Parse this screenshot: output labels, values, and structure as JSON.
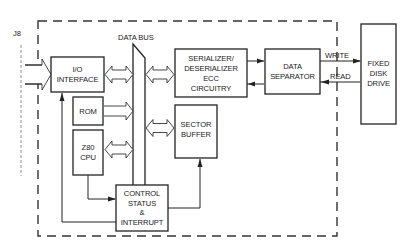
{
  "diagram": {
    "connector_label": "J8",
    "bus_label": "DATA BUS",
    "blocks": {
      "io_interface": [
        "I/O",
        "INTERFACE"
      ],
      "rom": [
        "ROM"
      ],
      "cpu": [
        "Z80",
        "CPU"
      ],
      "serializer": [
        "SERIALIZER/",
        "DESERIALIZER",
        "ECC",
        "CIRCUITRY"
      ],
      "sector_buffer": [
        "SECTOR",
        "BUFFER"
      ],
      "control": [
        "CONTROL",
        "STATUS",
        "&",
        "INTERRUPT"
      ],
      "data_separator": [
        "DATA",
        "SEPARATOR"
      ],
      "disk_drive": [
        "FIXED",
        "DISK",
        "DRIVE"
      ]
    },
    "signals": {
      "write": "WRITE",
      "read": "READ"
    }
  }
}
